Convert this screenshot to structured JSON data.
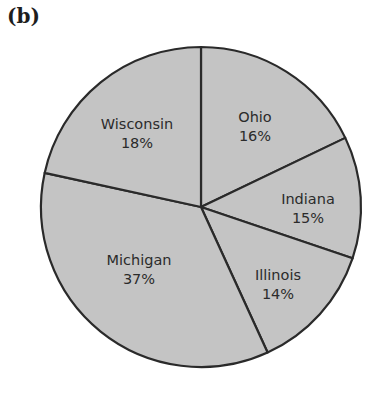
{
  "figure": {
    "panel_label": "(b)"
  },
  "chart_data": {
    "type": "pie",
    "title": "",
    "panel_label": "(b)",
    "categories": [
      "Ohio",
      "Indiana",
      "Illinois",
      "Michigan",
      "Wisconsin"
    ],
    "values": [
      16,
      15,
      14,
      37,
      18
    ],
    "unit": "%",
    "slice_labels": [
      "16%",
      "15%",
      "14%",
      "37%",
      "18%"
    ],
    "start_angle_deg": -90,
    "direction": "clockwise",
    "fill_color": "#c4c4c4",
    "edge_color": "#2a2a2a",
    "legend": "none",
    "labels_inside_slices": true
  },
  "slices": [
    {
      "name": "Ohio",
      "pct": "16%",
      "start": -90,
      "end": -25.6,
      "lx": 255,
      "ly": 122
    },
    {
      "name": "Indiana",
      "pct": "15%",
      "start": -25.6,
      "end": 18.7,
      "lx": 308,
      "ly": 204
    },
    {
      "name": "Illinois",
      "pct": "14%",
      "start": 18.7,
      "end": 65.4,
      "lx": 278,
      "ly": 280
    },
    {
      "name": "Michigan",
      "pct": "37%",
      "start": 65.4,
      "end": 192.3,
      "lx": 139,
      "ly": 265
    },
    {
      "name": "Wisconsin",
      "pct": "18%",
      "start": 192.3,
      "end": 270,
      "lx": 137,
      "ly": 129
    }
  ]
}
